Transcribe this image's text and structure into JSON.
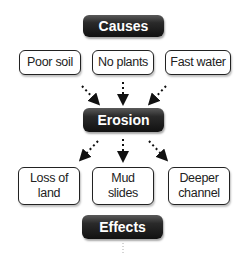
{
  "diagram": {
    "causes_header": "Causes",
    "causes": [
      "Poor soil",
      "No plants",
      "Fast water"
    ],
    "center": "Erosion",
    "effects": [
      {
        "line1": "Loss of",
        "line2": "land"
      },
      {
        "line1": "Mud",
        "line2": "slides"
      },
      {
        "line1": "Deeper",
        "line2": "channel"
      }
    ],
    "effects_header": "Effects"
  }
}
